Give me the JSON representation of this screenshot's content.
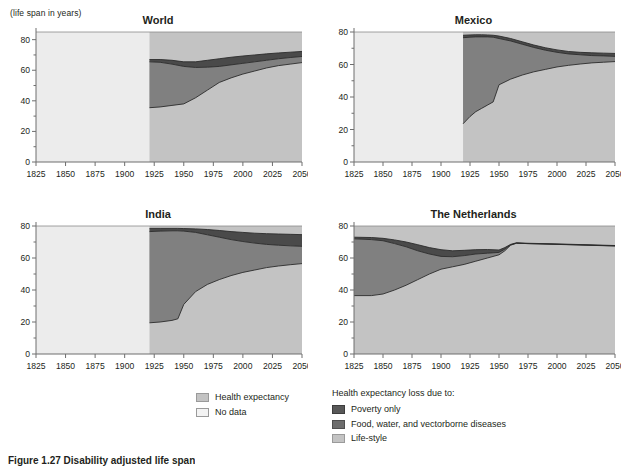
{
  "figure": {
    "y_axis_unit_label": "(life span in years)",
    "caption": "Figure 1.27  Disability adjusted life span",
    "colors": {
      "no_data": "#ececec",
      "health_expectancy": "#c3c3c3",
      "life_style": "#c3c3c3",
      "food_water_vectorborne": "#4a4a4a",
      "poverty_only": "#808080",
      "plot_background": "#c3c3c3",
      "axis": "#6e6e6e",
      "line": "#2b2b2b",
      "text": "#231f20"
    }
  },
  "legend_left": {
    "items": [
      {
        "label": "Health expectancy",
        "color": "#c3c3c3",
        "border": "#9a9a9a"
      },
      {
        "label": "No data",
        "color": "#f3f3f3",
        "border": "#9a9a9a"
      }
    ]
  },
  "legend_right": {
    "heading": "Health expectancy loss due to:",
    "items": [
      {
        "label": "Poverty only",
        "color": "#585858",
        "border": "#3d3d3d"
      },
      {
        "label": "Food, water, and vectorborne diseases",
        "color": "#6d6d6d",
        "border": "#4f4f4f"
      },
      {
        "label": "Life-style",
        "color": "#c3c3c3",
        "border": "#9a9a9a"
      }
    ]
  },
  "chart_data": {
    "type": "area",
    "title": "Disability adjusted life span",
    "ylabel": "(life span in years)",
    "xlabel": "",
    "xlim": [
      1825,
      2050
    ],
    "grid": false,
    "legend_position": "bottom",
    "xticks": [
      1825,
      1850,
      1875,
      1900,
      1925,
      1950,
      1975,
      2000,
      2025,
      2050
    ],
    "stack_order_from_bottom": [
      "Life-style",
      "Food, water, and vectorborne diseases",
      "Poverty only",
      "Health expectancy"
    ],
    "panels": [
      {
        "title": "World",
        "ylim": [
          0,
          85
        ],
        "yticks": [
          0,
          20,
          40,
          60,
          80
        ],
        "ytick_labels": [
          "0",
          "20",
          "40",
          "60",
          "80"
        ],
        "top_of_chart": 85,
        "no_data_until": 1921,
        "x": [
          1921,
          1930,
          1940,
          1950,
          1960,
          1970,
          1980,
          1990,
          2000,
          2010,
          2020,
          2030,
          2040,
          2050
        ],
        "series": [
          {
            "name": "Life-style (lower boundary)",
            "values": [
              35.5,
              36.0,
              37.0,
              38.0,
              42.0,
              47.0,
              52.0,
              55.0,
              57.5,
              59.5,
              61.5,
              63.0,
              64.0,
              65.0
            ]
          },
          {
            "name": "Poverty-only upper boundary",
            "values": [
              65.5,
              65.2,
              64.0,
              62.5,
              61.8,
              62.0,
              62.5,
              63.5,
              64.5,
              65.5,
              66.5,
              67.5,
              68.3,
              69.0
            ]
          },
          {
            "name": "Health expectancy upper boundary",
            "values": [
              67.0,
              67.0,
              66.5,
              65.5,
              65.5,
              66.5,
              67.5,
              68.5,
              69.3,
              70.0,
              70.7,
              71.3,
              71.8,
              72.3
            ]
          }
        ]
      },
      {
        "title": "Mexico",
        "ylim": [
          0,
          80
        ],
        "yticks": [
          0,
          20,
          40,
          60,
          80
        ],
        "ytick_labels": [
          "0",
          "20",
          "40",
          "60",
          "80"
        ],
        "top_of_chart": 80,
        "no_data_until": 1919,
        "x": [
          1919,
          1925,
          1930,
          1935,
          1940,
          1945,
          1950,
          1960,
          1970,
          1980,
          1990,
          2000,
          2010,
          2020,
          2030,
          2040,
          2050
        ],
        "series": [
          {
            "name": "Life-style (lower boundary)",
            "values": [
              23.5,
              28.0,
              31.0,
              33.0,
              35.0,
              37.0,
              47.5,
              51.0,
              53.5,
              55.5,
              57.0,
              58.5,
              59.5,
              60.3,
              61.0,
              61.4,
              61.8
            ]
          },
          {
            "name": "Poverty-only upper boundary",
            "values": [
              76.5,
              76.8,
              77.0,
              77.0,
              77.0,
              76.8,
              76.0,
              74.5,
              72.5,
              70.5,
              68.8,
              67.5,
              66.5,
              66.0,
              65.5,
              65.3,
              65.0
            ]
          },
          {
            "name": "Health expectancy upper boundary",
            "values": [
              78.0,
              78.2,
              78.3,
              78.3,
              78.2,
              78.0,
              77.5,
              76.0,
              74.0,
              72.0,
              70.3,
              69.0,
              68.0,
              67.5,
              67.2,
              67.0,
              66.8
            ]
          }
        ]
      },
      {
        "title": "India",
        "ylim": [
          0,
          80
        ],
        "yticks": [
          0,
          20,
          40,
          60,
          80
        ],
        "ytick_labels": [
          "0",
          "20",
          "40",
          "60",
          "80"
        ],
        "top_of_chart": 80,
        "no_data_until": 1921,
        "x": [
          1921,
          1930,
          1940,
          1945,
          1950,
          1960,
          1970,
          1980,
          1990,
          2000,
          2010,
          2020,
          2030,
          2040,
          2050
        ],
        "series": [
          {
            "name": "Life-style (lower boundary)",
            "values": [
              19.5,
              20.0,
              21.0,
              22.0,
              31.0,
              39.0,
              43.5,
              46.5,
              49.0,
              51.0,
              52.5,
              54.0,
              55.0,
              55.8,
              56.5
            ]
          },
          {
            "name": "Poverty-only upper boundary",
            "values": [
              76.5,
              76.8,
              77.0,
              77.0,
              76.8,
              76.0,
              74.5,
              73.0,
              71.5,
              70.3,
              69.3,
              68.5,
              68.0,
              67.6,
              67.3
            ]
          },
          {
            "name": "Health expectancy upper boundary",
            "values": [
              78.5,
              78.5,
              78.5,
              78.5,
              78.4,
              78.2,
              77.8,
              77.2,
              76.5,
              76.0,
              75.5,
              75.2,
              75.0,
              74.8,
              74.6
            ]
          }
        ]
      },
      {
        "title": "The Netherlands",
        "ylim": [
          0,
          80
        ],
        "yticks": [
          0,
          20,
          40,
          60,
          80
        ],
        "ytick_labels": [
          "0",
          "20",
          "40",
          "60",
          "80"
        ],
        "top_of_chart": 80,
        "no_data_until": null,
        "x": [
          1825,
          1840,
          1850,
          1860,
          1870,
          1880,
          1890,
          1900,
          1910,
          1920,
          1930,
          1940,
          1950,
          1955,
          1960,
          1965,
          1975,
          2000,
          2025,
          2050
        ],
        "series": [
          {
            "name": "Life-style (lower boundary)",
            "values": [
              36.5,
              36.5,
              37.5,
              40.0,
              43.0,
              46.5,
              50.0,
              53.0,
              54.5,
              56.0,
              58.0,
              60.0,
              62.0,
              64.5,
              68.0,
              69.2,
              69.0,
              68.5,
              68.0,
              67.5
            ]
          },
          {
            "name": "Poverty-only upper boundary",
            "values": [
              72.0,
              71.5,
              70.8,
              69.0,
              67.0,
              64.5,
              62.5,
              61.0,
              60.8,
              61.5,
              62.5,
              63.0,
              63.5,
              65.5,
              68.2,
              69.3,
              69.0,
              68.6,
              68.1,
              67.6
            ]
          },
          {
            "name": "Health expectancy upper boundary",
            "values": [
              73.0,
              72.8,
              72.3,
              71.3,
              70.0,
              68.3,
              66.5,
              65.2,
              64.5,
              64.8,
              65.2,
              65.3,
              65.0,
              66.5,
              68.5,
              69.5,
              69.2,
              68.8,
              68.3,
              67.8
            ]
          }
        ]
      }
    ]
  }
}
